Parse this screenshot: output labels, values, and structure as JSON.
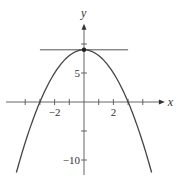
{
  "chart_data": {
    "type": "line",
    "title": "",
    "xlabel": "x",
    "ylabel": "y",
    "function": "y = 9 - x^2",
    "xlim": [
      -5.3,
      5.5
    ],
    "ylim": [
      -12.6,
      13.5
    ],
    "grid": false,
    "legend": null,
    "x_ticks": [
      -4,
      -3,
      -2,
      -1,
      1,
      2,
      3,
      4
    ],
    "y_ticks": [
      -10,
      -5,
      5,
      10
    ],
    "x_tick_labels": [
      {
        "value": -2,
        "label": "−2"
      },
      {
        "value": 2,
        "label": "2"
      }
    ],
    "y_tick_labels": [
      {
        "value": 5,
        "label": "5"
      },
      {
        "value": -10,
        "label": "−10"
      }
    ],
    "series": [
      {
        "name": "parabola",
        "x": [
          -4.6,
          -4,
          -3,
          -2,
          -1,
          0,
          1,
          2,
          3,
          4,
          4.6
        ],
        "y": [
          -12.16,
          -7,
          0,
          5,
          8,
          9,
          8,
          5,
          0,
          -7,
          -12.16
        ]
      },
      {
        "name": "horizontal tangent line",
        "x": [
          -3.0,
          3.0
        ],
        "y": [
          9,
          9
        ]
      }
    ],
    "annotations": [
      {
        "type": "point",
        "x": 0,
        "y": 9,
        "label": "vertex"
      }
    ],
    "colors": {
      "curve": "#444444",
      "axis": "#555555",
      "tangent": "#555555"
    }
  }
}
